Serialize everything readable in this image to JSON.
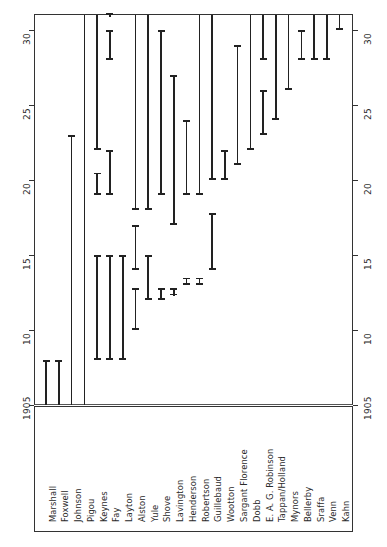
{
  "chart_data": {
    "type": "bar",
    "orientation": "horizontal-rotated",
    "title": "",
    "subtitle": "",
    "xlabel": "",
    "ylabel": "",
    "axis_ticks": [
      1905,
      10,
      15,
      20,
      25,
      30
    ],
    "axis_tick_values": [
      1905,
      1910,
      1915,
      1920,
      1925,
      1930
    ],
    "axis_range": [
      1905,
      1931
    ],
    "grid": false,
    "legend": null,
    "categories": [
      "Marshall",
      "Foxwell",
      "Johnson",
      "Pigou",
      "Keynes",
      "Fay",
      "Layton",
      "Alston",
      "Yule",
      "Shove",
      "Lavington",
      "Henderson",
      "Robertson",
      "Guillebaud",
      "Wootton",
      "Sargant Florence",
      "Dobb",
      "E. A. G. Robinson",
      "Tappan/Holland",
      "Mynors",
      "Bellerby",
      "Sraffa",
      "Venn",
      "Kahn"
    ],
    "series": [
      {
        "name": "intervals",
        "intervals": [
          {
            "label": "Marshall",
            "segments": [
              [
                1905,
                1908
              ]
            ]
          },
          {
            "label": "Foxwell",
            "segments": [
              [
                1905,
                1908
              ]
            ]
          },
          {
            "label": "Johnson",
            "segments": [
              [
                1905,
                1923
              ]
            ]
          },
          {
            "label": "Pigou",
            "segments": [
              [
                1905,
                1931
              ]
            ]
          },
          {
            "label": "Keynes",
            "segments": [
              [
                1908,
                1915
              ],
              [
                1919,
                1920.5
              ],
              [
                1922,
                1931
              ]
            ]
          },
          {
            "label": "Fay",
            "segments": [
              [
                1908,
                1915
              ],
              [
                1919,
                1922
              ],
              [
                1928,
                1930
              ],
              [
                1931,
                1931
              ]
            ]
          },
          {
            "label": "Layton",
            "segments": [
              [
                1908,
                1915
              ]
            ]
          },
          {
            "label": "Alston",
            "segments": [
              [
                1910,
                1912.8
              ],
              [
                1914,
                1917
              ],
              [
                1918,
                1931
              ]
            ]
          },
          {
            "label": "Yule",
            "segments": [
              [
                1912,
                1915
              ],
              [
                1918,
                1931
              ]
            ]
          },
          {
            "label": "Shove",
            "segments": [
              [
                1912,
                1912.8
              ],
              [
                1919,
                1930
              ]
            ]
          },
          {
            "label": "Lavington",
            "segments": [
              [
                1912.3,
                1912.8
              ],
              [
                1917,
                1927
              ]
            ]
          },
          {
            "label": "Henderson",
            "segments": [
              [
                1913,
                1913.5
              ],
              [
                1919,
                1924
              ]
            ]
          },
          {
            "label": "Robertson",
            "segments": [
              [
                1913,
                1913.5
              ],
              [
                1919,
                1931
              ]
            ]
          },
          {
            "label": "Guillebaud",
            "segments": [
              [
                1914,
                1917.8
              ],
              [
                1920,
                1931
              ]
            ]
          },
          {
            "label": "Wootton",
            "segments": [
              [
                1920,
                1922
              ]
            ]
          },
          {
            "label": "Sargant Florence",
            "segments": [
              [
                1921,
                1929
              ]
            ]
          },
          {
            "label": "Dobb",
            "segments": [
              [
                1922,
                1931
              ]
            ]
          },
          {
            "label": "E. A. G. Robinson",
            "segments": [
              [
                1923,
                1926
              ],
              [
                1928,
                1931
              ]
            ]
          },
          {
            "label": "Tappan/Holland",
            "segments": [
              [
                1924,
                1931
              ]
            ]
          },
          {
            "label": "Mynors",
            "segments": [
              [
                1926,
                1931
              ]
            ]
          },
          {
            "label": "Bellerby",
            "segments": [
              [
                1928,
                1930
              ]
            ]
          },
          {
            "label": "Sraffa",
            "segments": [
              [
                1928,
                1931
              ]
            ]
          },
          {
            "label": "Venn",
            "segments": [
              [
                1928,
                1931
              ]
            ]
          },
          {
            "label": "Kahn",
            "segments": [
              [
                1930,
                1931
              ]
            ]
          }
        ]
      }
    ]
  },
  "axis": {
    "left_ticks": [
      "1905",
      "10",
      "15",
      "20",
      "25",
      "30"
    ],
    "right_ticks": [
      "1905",
      "10",
      "15",
      "20",
      "25",
      "30"
    ]
  },
  "caption": ""
}
